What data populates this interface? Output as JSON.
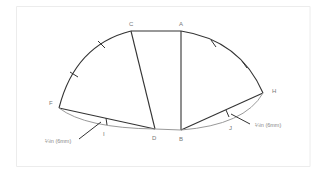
{
  "diagram": {
    "type": "pattern-construction",
    "points": {
      "A": "A",
      "B": "B",
      "C": "C",
      "D": "D",
      "F": "F",
      "H": "H",
      "I": "I",
      "J": "J"
    },
    "annotations": {
      "left": "¼in (6mm)",
      "right": "¼in (6mm)"
    },
    "colors": {
      "line": "#333333",
      "curve": "#999999",
      "border": "#e6e6e6",
      "label": "#777777"
    }
  }
}
